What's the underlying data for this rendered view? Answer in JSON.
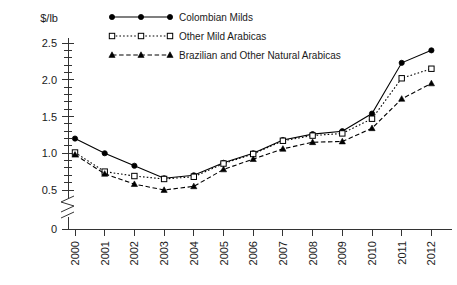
{
  "chart_data": {
    "type": "line",
    "title": "",
    "xlabel": "",
    "ylabel": "$/lb",
    "x": [
      2000,
      2001,
      2002,
      2003,
      2004,
      2005,
      2006,
      2007,
      2008,
      2009,
      2010,
      2011,
      2012
    ],
    "categories": [
      "2000",
      "2001",
      "2002",
      "2003",
      "2004",
      "2005",
      "2006",
      "2007",
      "2008",
      "2009",
      "2010",
      "2011",
      "2012"
    ],
    "ylim": [
      0,
      2.6
    ],
    "yticks": [
      0,
      0.5,
      1.0,
      1.5,
      2.0,
      2.5
    ],
    "ytick_labels": [
      "0",
      "0.5",
      "1.0",
      "1.5",
      "2.0",
      "2.5"
    ],
    "y_axis_break": true,
    "y_axis_break_between": [
      0,
      0.5
    ],
    "minor_tick_interval": 0.1,
    "grid": false,
    "legend_position": "top-center",
    "series": [
      {
        "name": "Colombian Milds",
        "marker": "filled-circle",
        "linestyle": "solid",
        "color": "#000000",
        "values": [
          1.2,
          1.0,
          0.83,
          0.66,
          0.7,
          0.87,
          1.0,
          1.18,
          1.26,
          1.3,
          1.54,
          2.23,
          2.4
        ]
      },
      {
        "name": "Other Mild Arabicas",
        "marker": "open-square",
        "linestyle": "dotted",
        "color": "#000000",
        "values": [
          1.01,
          0.75,
          0.69,
          0.65,
          0.68,
          0.86,
          0.99,
          1.17,
          1.24,
          1.27,
          1.47,
          2.02,
          2.15
        ]
      },
      {
        "name": "Brazilian and Other Natural Arabicas",
        "marker": "filled-triangle",
        "linestyle": "dashed",
        "color": "#000000",
        "values": [
          0.98,
          0.72,
          0.58,
          0.5,
          0.55,
          0.78,
          0.92,
          1.06,
          1.15,
          1.16,
          1.34,
          1.74,
          1.95
        ]
      }
    ]
  },
  "legend": {
    "items": [
      {
        "label": "Colombian Milds"
      },
      {
        "label": "Other Mild Arabicas"
      },
      {
        "label": "Brazilian and Other Natural Arabicas"
      }
    ]
  },
  "axis": {
    "y_title": "$/lb"
  }
}
